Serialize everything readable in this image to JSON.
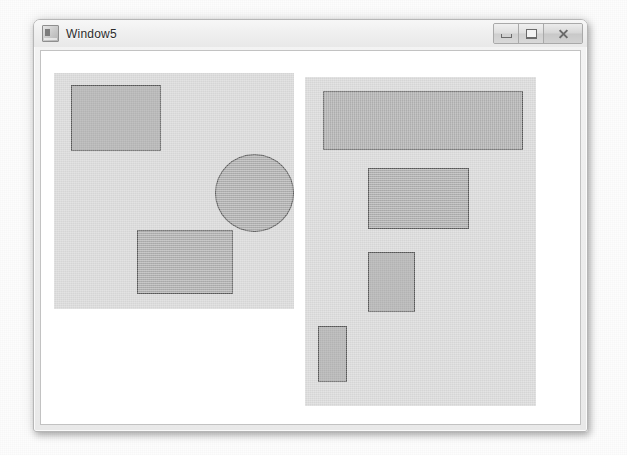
{
  "window": {
    "title": "Window5",
    "app_icon": "application-icon",
    "caption_buttons": [
      {
        "name": "minimize-button",
        "label": "Minimize",
        "glyph": "minimize-icon"
      },
      {
        "name": "maximize-button",
        "label": "Maximize",
        "glyph": "maximize-icon"
      },
      {
        "name": "close-button",
        "label": "Close",
        "glyph": "close-icon"
      }
    ]
  },
  "colors": {
    "panel_fill": "#d5d5d5",
    "shape_fill": "#a8a8a8",
    "shape_stroke": "#565656",
    "client_background": "#ffffff",
    "window_chrome": "#eeeeee"
  },
  "canvas": {
    "panels": [
      {
        "name": "left-panel",
        "x": 13,
        "y": 22,
        "width": 240,
        "height": 236,
        "shapes": [
          {
            "name": "shape-rectangle-1",
            "type": "rectangle",
            "x": 17,
            "y": 12,
            "width": 90,
            "height": 66
          },
          {
            "name": "shape-circle-1",
            "type": "circle",
            "x": 161,
            "y": 81,
            "width": 79,
            "height": 78
          },
          {
            "name": "shape-rectangle-2",
            "type": "rectangle",
            "x": 83,
            "y": 157,
            "width": 96,
            "height": 64
          }
        ]
      },
      {
        "name": "right-panel",
        "x": 264,
        "y": 26,
        "width": 231,
        "height": 329,
        "shapes": [
          {
            "name": "shape-rectangle-3",
            "type": "rectangle",
            "x": 18,
            "y": 14,
            "width": 200,
            "height": 59
          },
          {
            "name": "shape-rectangle-4",
            "type": "rectangle",
            "x": 63,
            "y": 91,
            "width": 101,
            "height": 61
          },
          {
            "name": "shape-rectangle-5",
            "type": "rectangle",
            "x": 63,
            "y": 175,
            "width": 47,
            "height": 60
          },
          {
            "name": "shape-rectangle-6",
            "type": "rectangle",
            "x": 13,
            "y": 249,
            "width": 29,
            "height": 56
          }
        ]
      }
    ]
  }
}
